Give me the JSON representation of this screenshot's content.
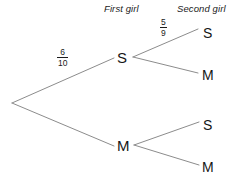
{
  "diagram": {
    "background_color": "#ffffff",
    "line_color": "#8c8c8c",
    "text_color": "#161616",
    "headers": {
      "first_stage": "First girl",
      "second_stage": "Second girl"
    },
    "root": {
      "label": ""
    },
    "first_stage_nodes": [
      {
        "id": "S",
        "label": "S",
        "probability_numerator": "6",
        "probability_denominator": "10"
      },
      {
        "id": "M",
        "label": "M",
        "probability_numerator": "",
        "probability_denominator": ""
      }
    ],
    "second_stage_nodes": [
      {
        "id": "SS",
        "label": "S",
        "parent": "S",
        "probability_numerator": "5",
        "probability_denominator": "9"
      },
      {
        "id": "SM",
        "label": "M",
        "parent": "S",
        "probability_numerator": "",
        "probability_denominator": ""
      },
      {
        "id": "MS",
        "label": "S",
        "parent": "M",
        "probability_numerator": "",
        "probability_denominator": ""
      },
      {
        "id": "MM",
        "label": "M",
        "parent": "M",
        "probability_numerator": "",
        "probability_denominator": ""
      }
    ],
    "fractions": {
      "first_branch": {
        "numerator": "6",
        "denominator": "10"
      },
      "second_branch": {
        "numerator": "5",
        "denominator": "9"
      }
    }
  }
}
